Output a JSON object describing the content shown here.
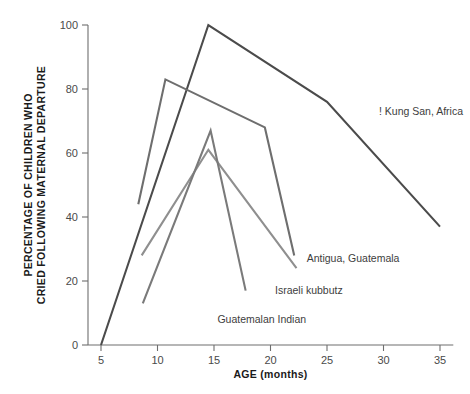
{
  "chart_data": {
    "type": "line",
    "title": "",
    "xlabel": "AGE (months)",
    "ylabel": "PERCENTAGE OF CHILDREN WHO CRIED FOLLOWING MATERNAL DEPARTURE",
    "ylabel_line1": "PERCENTAGE OF CHILDREN WHO",
    "ylabel_line2": "CRIED FOLLOWING MATERNAL DEPARTURE",
    "xlim": [
      3,
      36
    ],
    "ylim": [
      0,
      100
    ],
    "xticks": [
      5,
      10,
      15,
      20,
      25,
      30,
      35
    ],
    "yticks": [
      0,
      20,
      40,
      60,
      80,
      100
    ],
    "xtick_labels": [
      "5",
      "10",
      "15",
      "20",
      "25",
      "30",
      "35"
    ],
    "ytick_labels": [
      "0",
      "20",
      "40",
      "60",
      "80",
      "100"
    ],
    "grid": false,
    "legend_position": "inline-annotations",
    "series": [
      {
        "name": "! Kung San, Africa",
        "color": "#4b4b4b",
        "label_x": 29.6,
        "label_y": 72,
        "points": [
          {
            "x": 5,
            "y": 0
          },
          {
            "x": 14.5,
            "y": 100
          },
          {
            "x": 25,
            "y": 76
          },
          {
            "x": 35,
            "y": 37
          }
        ]
      },
      {
        "name": "Antigua, Guatemala",
        "color": "#6e6e6e",
        "label_x": 23.2,
        "label_y": 26,
        "points": [
          {
            "x": 8.3,
            "y": 44
          },
          {
            "x": 10.7,
            "y": 83
          },
          {
            "x": 19.5,
            "y": 68
          },
          {
            "x": 22.1,
            "y": 28
          }
        ]
      },
      {
        "name": "Israeli kubbutz",
        "color": "#8f8f8f",
        "label_x": 20.4,
        "label_y": 16,
        "points": [
          {
            "x": 8.6,
            "y": 28
          },
          {
            "x": 14.5,
            "y": 61
          },
          {
            "x": 22.3,
            "y": 24
          }
        ]
      },
      {
        "name": "Guatemalan Indian",
        "color": "#7a7a7a",
        "label_x": 15.3,
        "label_y": 7,
        "points": [
          {
            "x": 8.7,
            "y": 13
          },
          {
            "x": 14.7,
            "y": 67
          },
          {
            "x": 17.8,
            "y": 17
          }
        ]
      }
    ]
  }
}
